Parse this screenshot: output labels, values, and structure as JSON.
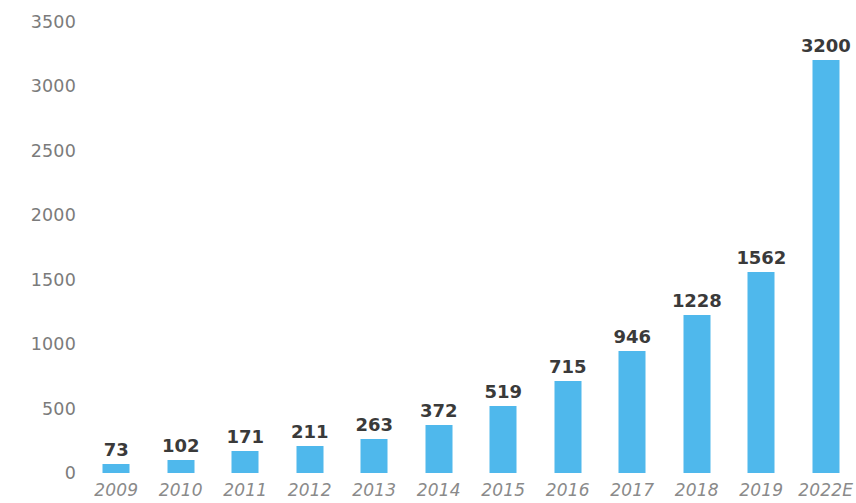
{
  "chart_data": {
    "type": "bar",
    "title": "",
    "subtitle": "",
    "xlabel": "",
    "ylabel": "",
    "categories": [
      "2009",
      "2010",
      "2011",
      "2012",
      "2013",
      "2014",
      "2015",
      "2016",
      "2017",
      "2018",
      "2019",
      "2022E"
    ],
    "values": [
      73,
      102,
      171,
      211,
      263,
      372,
      519,
      715,
      946,
      1228,
      1562,
      3200
    ],
    "data_labels": [
      "73",
      "102",
      "171",
      "211",
      "263",
      "372",
      "519",
      "715",
      "946",
      "1228",
      "1562",
      "3200"
    ],
    "ylim": [
      0,
      3500
    ],
    "y_ticks": [
      0,
      500,
      1000,
      1500,
      2000,
      2500,
      3000,
      3500
    ],
    "y_tick_labels": [
      "0",
      "500",
      "1000",
      "1500",
      "2000",
      "2500",
      "3000",
      "3500"
    ],
    "grid": false,
    "legend": null,
    "legend_position": "none",
    "series": [
      {
        "name": "",
        "values": [
          73,
          102,
          171,
          211,
          263,
          372,
          519,
          715,
          946,
          1228,
          1562,
          3200
        ]
      }
    ],
    "colors": {
      "bar": "#4fb8ec",
      "background": "#ffffff",
      "data_label_text": "#3a3a3a",
      "axis_label_text": "#7b7b7b",
      "x_axis_label_text": "#8a8a8a"
    }
  }
}
